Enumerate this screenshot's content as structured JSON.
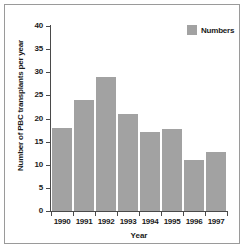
{
  "chart_data": {
    "type": "bar",
    "title": "",
    "xlabel": "Year",
    "ylabel": "Number of PBC transplants per year",
    "categories": [
      "1990",
      "1991",
      "1992",
      "1993",
      "1994",
      "1995",
      "1996",
      "1997"
    ],
    "values": [
      18,
      24,
      29,
      21,
      17,
      17.7,
      11.1,
      12.8
    ],
    "series": [
      {
        "name": "Numbers",
        "values": [
          18,
          24,
          29,
          21,
          17,
          17.7,
          11.1,
          12.8
        ]
      }
    ],
    "ylim": [
      0,
      40
    ],
    "yticks": [
      "0",
      "5",
      "10",
      "15",
      "20",
      "25",
      "30",
      "35",
      "40"
    ],
    "ytick_values": [
      0,
      5,
      10,
      15,
      20,
      25,
      30,
      35,
      40
    ],
    "grid": false,
    "legend": {
      "position": "top-right",
      "entries": [
        "Numbers"
      ]
    },
    "colors": {
      "bar": "#a2a2a2",
      "axis": "#4a4a4a",
      "text": "#1a1a1a",
      "background": "#ffffff",
      "frame": "#9a9a9a"
    }
  }
}
